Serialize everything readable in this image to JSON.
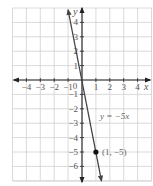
{
  "chart_data": {
    "type": "line",
    "title": "",
    "xlabel": "x",
    "ylabel": "y",
    "xlim": [
      -5,
      5
    ],
    "ylim": [
      -7,
      5
    ],
    "grid": true,
    "x_ticks": [
      -4,
      -3,
      -2,
      -1,
      1,
      2,
      3,
      4
    ],
    "x_tick_labels": [
      "−4",
      "−3",
      "−2",
      "−1",
      "1",
      "2",
      "3",
      "4"
    ],
    "y_ticks": [
      1,
      2,
      3,
      4,
      -1,
      -2,
      -3,
      -4,
      -5,
      -6
    ],
    "y_tick_labels": [
      "1",
      "2",
      "3",
      "4",
      "−1",
      "−2",
      "−3",
      "−4",
      "−5",
      "−6"
    ],
    "origin_label": "0",
    "series": [
      {
        "name": "y = −5x",
        "equation": "y = -5x",
        "slope": -5,
        "intercept": 0,
        "x": [
          -1,
          1.4
        ],
        "y": [
          5,
          -7
        ]
      }
    ],
    "points": [
      {
        "x": 1,
        "y": -5,
        "label": "(1, −5)"
      }
    ],
    "annotations": [
      {
        "text": "y = −5x",
        "x": 1.3,
        "y": -2.7
      }
    ]
  }
}
